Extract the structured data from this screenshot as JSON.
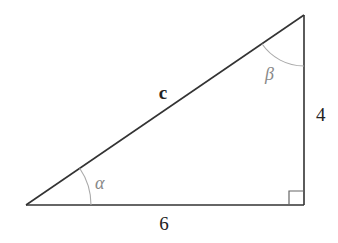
{
  "diagram": {
    "type": "right-triangle",
    "vertices": {
      "left": [
        26,
        205
      ],
      "top_right": [
        304,
        15
      ],
      "bottom_right": [
        304,
        205
      ]
    },
    "labels": {
      "hypotenuse": "c",
      "vertical_side": "4",
      "horizontal_side": "6",
      "angle_left": "α",
      "angle_top": "β"
    },
    "colors": {
      "line": "#333333",
      "arc": "#aaaaaa",
      "angle_label": "#888888",
      "text": "#222222"
    }
  }
}
